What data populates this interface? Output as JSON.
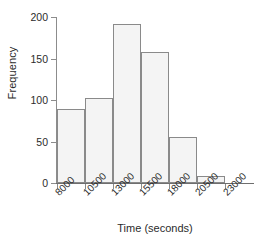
{
  "chart_data": {
    "type": "bar",
    "title": "",
    "subtitle": "",
    "xlabel": "Time (seconds)",
    "ylabel": "Frequency",
    "grid": false,
    "legend": "none",
    "bin_width": 2500,
    "bin_edges": [
      8000,
      10500,
      13000,
      15500,
      18000,
      20500,
      23000
    ],
    "categories": [
      "8000-10500",
      "10500-13000",
      "13000-15500",
      "15500-18000",
      "18000-20500",
      "20500-23000"
    ],
    "values": [
      89,
      103,
      192,
      158,
      56,
      8
    ],
    "x_tick_labels": [
      "8000",
      "10500",
      "13000",
      "15500",
      "18000",
      "20500",
      "23000"
    ],
    "y_tick_labels": [
      "0",
      "50",
      "100",
      "150",
      "200"
    ],
    "y_ticks": [
      0,
      50,
      100,
      150,
      200
    ],
    "xlim": [
      8000,
      23000
    ],
    "ylim": [
      0,
      200
    ],
    "bar_fill_color": "#f4f4f4",
    "bar_border_color": "#8a8a8a",
    "axis_color": "#8c8c8c",
    "text_color": "#2b2b2b",
    "background_color": "#ffffff"
  }
}
